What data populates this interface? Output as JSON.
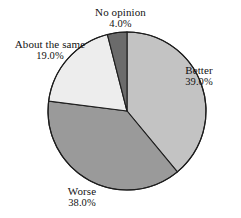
{
  "chart_data": {
    "type": "pie",
    "title": "",
    "subtitle": "",
    "xlabel": "",
    "ylabel": "",
    "legend_position": "none",
    "grid": false,
    "value_suffix": "%",
    "start_angle_deg": 0,
    "direction": "clockwise",
    "categories": [
      "Better",
      "Worse",
      "About the same",
      "No opinion"
    ],
    "values": [
      39.0,
      38.0,
      19.0,
      4.0
    ],
    "slices": [
      {
        "label": "Better",
        "value": "39.0%",
        "value_number": 39.0,
        "color": "#c3c3c3",
        "label_position": "right"
      },
      {
        "label": "Worse",
        "value": "38.0%",
        "value_number": 38.0,
        "color": "#9a9a9a",
        "label_position": "bottom"
      },
      {
        "label": "About the same",
        "value": "19.0%",
        "value_number": 19.0,
        "color": "#ededed",
        "label_position": "upper-left"
      },
      {
        "label": "No opinion",
        "value": "4.0%",
        "value_number": 4.0,
        "color": "#6b6b6b",
        "label_position": "top"
      }
    ],
    "outline_color": "#1d1d1d",
    "background_color": "#ffffff"
  }
}
